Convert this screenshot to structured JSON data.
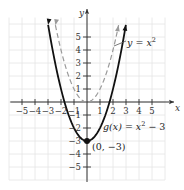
{
  "chart_data": {
    "type": "line",
    "title": "",
    "xlabel": "x",
    "ylabel": "y",
    "xlim": [
      -6,
      6
    ],
    "ylim": [
      -6,
      6.5
    ],
    "grid": true,
    "x_ticks": [
      -5,
      -4,
      -3,
      -2,
      -1,
      1,
      2,
      3,
      4,
      5
    ],
    "y_ticks": [
      -5,
      -4,
      -3,
      -2,
      -1,
      1,
      2,
      3,
      4,
      5
    ],
    "x_tick_labels": [
      "−5",
      "−4",
      "−3",
      "−2",
      "−1",
      "1",
      "2",
      "3",
      "4",
      "5"
    ],
    "y_tick_labels": [
      "−5",
      "−4",
      "−3",
      "−2",
      "−1",
      "1",
      "2",
      "3",
      "4",
      "5"
    ],
    "series": [
      {
        "name": "y = x²",
        "style": "dashed",
        "color": "#9a9a9a",
        "equation": "y = x^2",
        "x": [
          -2.4,
          -2,
          -1.5,
          -1,
          -0.5,
          0,
          0.5,
          1,
          1.5,
          2,
          2.4
        ],
        "y": [
          5.76,
          4,
          2.25,
          1,
          0.25,
          0,
          0.25,
          1,
          2.25,
          4,
          5.76
        ]
      },
      {
        "name": "g(x) = x² − 3",
        "style": "solid",
        "color": "#111111",
        "equation": "g(x) = x^2 - 3",
        "x": [
          -3,
          -2.5,
          -2,
          -1.5,
          -1,
          -0.5,
          0,
          0.5,
          1,
          1.5,
          2,
          2.5,
          3
        ],
        "y": [
          6,
          3.25,
          1,
          -0.75,
          -2,
          -2.75,
          -3,
          -2.75,
          -2,
          -0.75,
          1,
          3.25,
          6
        ]
      }
    ],
    "annotations": [
      {
        "text": "y = x²",
        "target": "y = x² curve"
      },
      {
        "text": "g(x) = x² − 3",
        "target": "g(x) curve"
      },
      {
        "text": "(0, −3)",
        "point": [
          0,
          -3
        ],
        "marker": "filled-circle"
      }
    ]
  },
  "labels": {
    "x_axis": "x",
    "y_axis": "y",
    "annot_f_pre": "y = ",
    "annot_f_var": "x",
    "annot_f_exp": "2",
    "annot_g_func": "g(x)",
    "annot_g_eq": " = ",
    "annot_g_var": "x",
    "annot_g_exp": "2",
    "annot_g_tail": " − 3",
    "vertex_label": "(0, −3)"
  }
}
